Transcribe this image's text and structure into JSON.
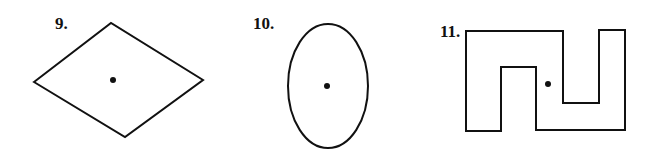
{
  "figures": [
    {
      "number": "9.",
      "shape": "rhombus",
      "label_pos": [
        55,
        14
      ]
    },
    {
      "number": "10.",
      "shape": "ellipse",
      "label_pos": [
        253,
        14
      ]
    },
    {
      "number": "11.",
      "shape": "interlocking-u-polygon",
      "label_pos": [
        440,
        22
      ]
    }
  ],
  "colors": {
    "stroke": "#111111",
    "background": "#ffffff"
  }
}
